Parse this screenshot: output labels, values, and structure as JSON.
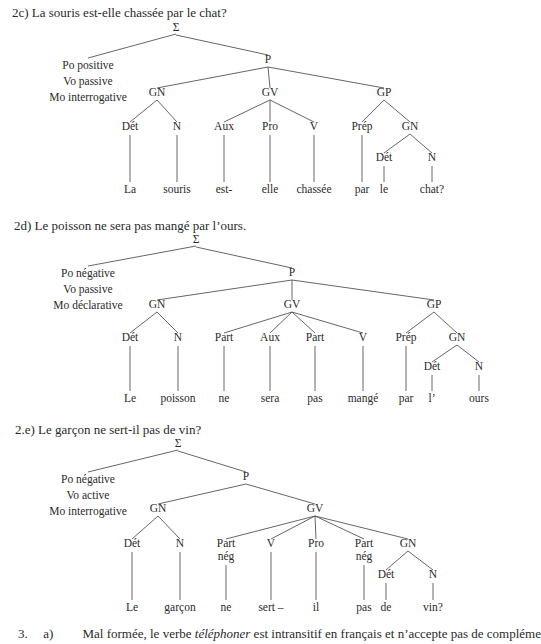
{
  "trees": [
    {
      "heading": "2c) La souris est-elle chassée par le chat?",
      "heading_pos": [
        12,
        5
      ],
      "modalities": [
        "Po positive",
        "Vo passive",
        "Mo interrogative"
      ],
      "nodes": [
        {
          "id": "S",
          "label": "Σ",
          "x": 176,
          "y": 31
        },
        {
          "id": "P",
          "label": "P",
          "x": 268,
          "y": 63
        },
        {
          "id": "GN",
          "label": "GN",
          "x": 157,
          "y": 96
        },
        {
          "id": "GV",
          "label": "GV",
          "x": 270,
          "y": 96
        },
        {
          "id": "GP",
          "label": "GP",
          "x": 384,
          "y": 96
        },
        {
          "id": "Det1",
          "label": "Dét",
          "x": 130,
          "y": 130
        },
        {
          "id": "N1",
          "label": "N",
          "x": 177,
          "y": 130
        },
        {
          "id": "Aux",
          "label": "Aux",
          "x": 224,
          "y": 130
        },
        {
          "id": "Pro",
          "label": "Pro",
          "x": 270,
          "y": 130
        },
        {
          "id": "V",
          "label": "V",
          "x": 314,
          "y": 130
        },
        {
          "id": "Prep",
          "label": "Prép",
          "x": 362,
          "y": 130
        },
        {
          "id": "GN2",
          "label": "GN",
          "x": 410,
          "y": 130
        },
        {
          "id": "Det2",
          "label": "Dét",
          "x": 384,
          "y": 161
        },
        {
          "id": "N2",
          "label": "N",
          "x": 432,
          "y": 161
        }
      ],
      "words": [
        {
          "label": "La",
          "x": 130,
          "y": 193,
          "parent": "Det1"
        },
        {
          "label": "souris",
          "x": 177,
          "y": 193,
          "parent": "N1"
        },
        {
          "label": "est-",
          "x": 224,
          "y": 193,
          "parent": "Aux"
        },
        {
          "label": "elle",
          "x": 270,
          "y": 193,
          "parent": "Pro"
        },
        {
          "label": "chassée",
          "x": 314,
          "y": 193,
          "parent": "V"
        },
        {
          "label": "par",
          "x": 362,
          "y": 193,
          "parent": "Prep"
        },
        {
          "label": "le",
          "x": 384,
          "y": 193,
          "parent": "Det2"
        },
        {
          "label": "chat?",
          "x": 432,
          "y": 193,
          "parent": "N2"
        }
      ],
      "edges": [
        [
          "S",
          "P"
        ],
        [
          "P",
          "GN"
        ],
        [
          "P",
          "GV"
        ],
        [
          "P",
          "GP"
        ],
        [
          "GN",
          "Det1"
        ],
        [
          "GN",
          "N1"
        ],
        [
          "GV",
          "Aux"
        ],
        [
          "GV",
          "Pro"
        ],
        [
          "GV",
          "V"
        ],
        [
          "GP",
          "Prep"
        ],
        [
          "GP",
          "GN2"
        ],
        [
          "GN2",
          "Det2"
        ],
        [
          "GN2",
          "N2"
        ]
      ],
      "mod_edge": [
        88,
        58
      ]
    },
    {
      "heading": "2d) Le poisson ne sera pas mangé par l’ours.",
      "heading_pos": [
        14,
        218
      ],
      "modalities": [
        "Po négative",
        "Vo passive",
        "Mo déclarative"
      ],
      "nodes": [
        {
          "id": "S",
          "label": "Σ",
          "x": 196,
          "y": 243
        },
        {
          "id": "P",
          "label": "P",
          "x": 292,
          "y": 276
        },
        {
          "id": "GN",
          "label": "GN",
          "x": 157,
          "y": 308
        },
        {
          "id": "GV",
          "label": "GV",
          "x": 292,
          "y": 308
        },
        {
          "id": "GP",
          "label": "GP",
          "x": 434,
          "y": 308
        },
        {
          "id": "Det1",
          "label": "Dét",
          "x": 130,
          "y": 341
        },
        {
          "id": "N1",
          "label": "N",
          "x": 178,
          "y": 341
        },
        {
          "id": "Part1",
          "label": "Part",
          "x": 224,
          "y": 341
        },
        {
          "id": "Aux",
          "label": "Aux",
          "x": 270,
          "y": 341
        },
        {
          "id": "Part2",
          "label": "Part",
          "x": 315,
          "y": 341
        },
        {
          "id": "V",
          "label": "V",
          "x": 363,
          "y": 341
        },
        {
          "id": "Prep",
          "label": "Prép",
          "x": 406,
          "y": 341
        },
        {
          "id": "GN2",
          "label": "GN",
          "x": 457,
          "y": 341
        },
        {
          "id": "Det2",
          "label": "Dét",
          "x": 432,
          "y": 370
        },
        {
          "id": "N2",
          "label": "N",
          "x": 479,
          "y": 370
        }
      ],
      "words": [
        {
          "label": "Le",
          "x": 130,
          "y": 402,
          "parent": "Det1"
        },
        {
          "label": "poisson",
          "x": 178,
          "y": 402,
          "parent": "N1"
        },
        {
          "label": "ne",
          "x": 224,
          "y": 402,
          "parent": "Part1"
        },
        {
          "label": "sera",
          "x": 270,
          "y": 402,
          "parent": "Aux"
        },
        {
          "label": "pas",
          "x": 315,
          "y": 402,
          "parent": "Part2"
        },
        {
          "label": "mangé",
          "x": 363,
          "y": 402,
          "parent": "V"
        },
        {
          "label": "par",
          "x": 406,
          "y": 402,
          "parent": "Prep"
        },
        {
          "label": "l’",
          "x": 432,
          "y": 402,
          "parent": "Det2"
        },
        {
          "label": "ours",
          "x": 479,
          "y": 402,
          "parent": "N2"
        }
      ],
      "edges": [
        [
          "S",
          "P"
        ],
        [
          "P",
          "GN"
        ],
        [
          "P",
          "GV"
        ],
        [
          "P",
          "GP"
        ],
        [
          "GN",
          "Det1"
        ],
        [
          "GN",
          "N1"
        ],
        [
          "GV",
          "Part1"
        ],
        [
          "GV",
          "Aux"
        ],
        [
          "GV",
          "Part2"
        ],
        [
          "GV",
          "V"
        ],
        [
          "GP",
          "Prep"
        ],
        [
          "GP",
          "GN2"
        ],
        [
          "GN2",
          "Det2"
        ],
        [
          "GN2",
          "N2"
        ]
      ],
      "mod_edge": [
        88,
        266
      ]
    },
    {
      "heading": "2.e) Le garçon ne sert-il pas de vin?",
      "heading_pos": [
        15,
        422
      ],
      "modalities": [
        "Po négative",
        "Vo active",
        "Mo interrogative"
      ],
      "nodes": [
        {
          "id": "S",
          "label": "Σ",
          "x": 178,
          "y": 447
        },
        {
          "id": "P",
          "label": "P",
          "x": 246,
          "y": 480
        },
        {
          "id": "GN",
          "label": "GN",
          "x": 158,
          "y": 512
        },
        {
          "id": "GV",
          "label": "GV",
          "x": 315,
          "y": 512
        },
        {
          "id": "Det1",
          "label": "Dét",
          "x": 132,
          "y": 547
        },
        {
          "id": "N1",
          "label": "N",
          "x": 180,
          "y": 547
        },
        {
          "id": "Part1",
          "label": "Part|nég",
          "x": 226,
          "y": 547
        },
        {
          "id": "V",
          "label": "V",
          "x": 271,
          "y": 547
        },
        {
          "id": "Pro",
          "label": "Pro",
          "x": 316,
          "y": 547
        },
        {
          "id": "Part2",
          "label": "Part|nég",
          "x": 364,
          "y": 547
        },
        {
          "id": "GN2",
          "label": "GN",
          "x": 408,
          "y": 547
        },
        {
          "id": "Det2",
          "label": "Dét",
          "x": 386,
          "y": 578
        },
        {
          "id": "N2",
          "label": "N",
          "x": 433,
          "y": 578
        }
      ],
      "words": [
        {
          "label": "Le",
          "x": 132,
          "y": 611,
          "parent": "Det1"
        },
        {
          "label": "garçon",
          "x": 180,
          "y": 611,
          "parent": "N1"
        },
        {
          "label": "ne",
          "x": 226,
          "y": 611,
          "parent": "Part1"
        },
        {
          "label": "sert –",
          "x": 271,
          "y": 611,
          "parent": "V"
        },
        {
          "label": "il",
          "x": 316,
          "y": 611,
          "parent": "Pro"
        },
        {
          "label": "pas",
          "x": 364,
          "y": 611,
          "parent": "Part2"
        },
        {
          "label": "de",
          "x": 386,
          "y": 611,
          "parent": "Det2"
        },
        {
          "label": "vin?",
          "x": 433,
          "y": 611,
          "parent": "N2"
        }
      ],
      "edges": [
        [
          "S",
          "P"
        ],
        [
          "P",
          "GN"
        ],
        [
          "P",
          "GV"
        ],
        [
          "GN",
          "Det1"
        ],
        [
          "GN",
          "N1"
        ],
        [
          "GV",
          "Part1"
        ],
        [
          "GV",
          "V"
        ],
        [
          "GV",
          "Pro"
        ],
        [
          "GV",
          "Part2"
        ],
        [
          "GV",
          "GN2"
        ],
        [
          "GN2",
          "Det2"
        ],
        [
          "GN2",
          "N2"
        ]
      ],
      "mod_edge": [
        88,
        472
      ]
    }
  ],
  "footer": {
    "number": "3.",
    "sub": "a)",
    "text_before": "Mal formée, le verbe ",
    "italic": "téléphoner",
    "text_after": " est intransitif en français et n’accepte pas de compléme"
  }
}
